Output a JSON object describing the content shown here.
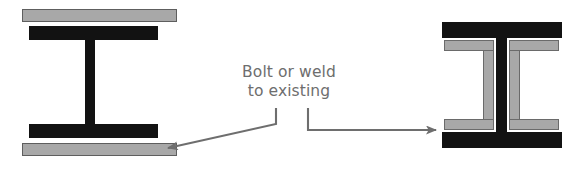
{
  "diagram": {
    "callout": {
      "line1": "Bolt or weld",
      "line2": "to existing",
      "text_color": "#6e6e6e"
    },
    "colors": {
      "existing_steel": "#121212",
      "added_steel": "#a8a8a8",
      "added_steel_outline": "#5e5e5e",
      "leader_line": "#6e6e6e",
      "background": "#ffffff"
    },
    "left_detail": {
      "name": "flange-plate-reinforcement",
      "existing_member": "I-beam",
      "added_members": [
        "top cover plate",
        "bottom cover plate"
      ],
      "top_plate": {
        "x": 22,
        "y": 9,
        "w": 155,
        "h": 13
      },
      "top_flange": {
        "x": 29,
        "y": 26,
        "w": 129,
        "h": 14
      },
      "web": {
        "x": 85,
        "y": 40,
        "w": 10,
        "h": 84
      },
      "bottom_flange": {
        "x": 29,
        "y": 124,
        "w": 129,
        "h": 14
      },
      "bottom_plate": {
        "x": 22,
        "y": 143,
        "w": 155,
        "h": 13
      }
    },
    "right_detail": {
      "name": "web-channel-reinforcement",
      "existing_member": "I-beam",
      "added_members": [
        "left channel",
        "right channel"
      ],
      "top_flange": {
        "x": 442,
        "y": 22,
        "w": 120,
        "h": 16
      },
      "web": {
        "x": 496,
        "y": 38,
        "w": 11,
        "h": 94
      },
      "bottom_flange": {
        "x": 442,
        "y": 132,
        "w": 120,
        "h": 16
      },
      "left_channel": {
        "x": 444,
        "y": 40,
        "w": 50,
        "h": 90
      },
      "right_channel": {
        "x": 509,
        "y": 40,
        "w": 50,
        "h": 90
      },
      "channel_thickness": 11
    },
    "leaders": [
      {
        "name": "leader-to-cover-plate",
        "from": [
          276,
          108
        ],
        "elbow": [
          276,
          124
        ],
        "to": [
          168,
          148
        ],
        "target": "bottom cover plate"
      },
      {
        "name": "leader-to-channel",
        "from": [
          308,
          108
        ],
        "elbow": [
          308,
          130
        ],
        "to": [
          436,
          130
        ],
        "target": "web channel"
      }
    ]
  }
}
